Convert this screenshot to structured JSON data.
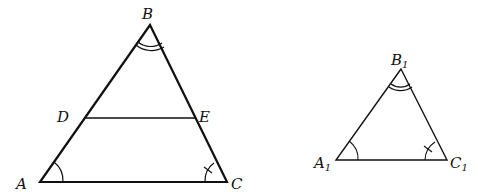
{
  "figure": {
    "big_triangle": {
      "vertices": {
        "A": "A",
        "B": "B",
        "C": "C"
      },
      "segment_points": {
        "D": "D",
        "E": "E"
      }
    },
    "small_triangle": {
      "vertices": {
        "A": "A",
        "B": "B",
        "C": "C"
      },
      "subscript": "1"
    },
    "angle_marks": {
      "A": "single-arc",
      "B": "double-arc",
      "C": "arc-with-tick"
    },
    "stroke_color": "#111111"
  }
}
